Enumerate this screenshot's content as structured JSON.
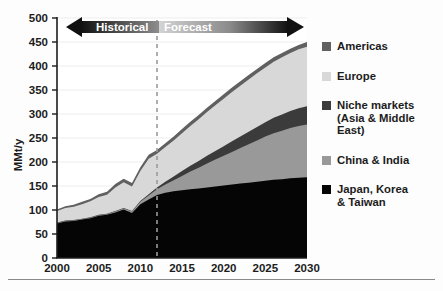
{
  "chart_data": {
    "type": "area",
    "stacked": true,
    "title": "",
    "xlabel": "",
    "ylabel": "MMt/y",
    "xlim": [
      2000,
      2030
    ],
    "ylim": [
      0,
      500
    ],
    "xticks": [
      2000,
      2005,
      2010,
      2015,
      2020,
      2025,
      2030
    ],
    "yticks": [
      0,
      50,
      100,
      150,
      200,
      250,
      300,
      350,
      400,
      450,
      500
    ],
    "grid": true,
    "grid_axis": "y",
    "legend_position": "right",
    "x": [
      2000,
      2001,
      2002,
      2003,
      2004,
      2005,
      2006,
      2007,
      2008,
      2009,
      2010,
      2011,
      2012,
      2013,
      2014,
      2015,
      2016,
      2017,
      2018,
      2019,
      2020,
      2021,
      2022,
      2023,
      2024,
      2025,
      2026,
      2027,
      2028,
      2029,
      2030
    ],
    "series": [
      {
        "name": "Japan, Korea & Taiwan",
        "color": "#050505",
        "values": [
          72,
          76,
          77,
          80,
          83,
          88,
          90,
          95,
          101,
          94,
          112,
          122,
          131,
          136,
          139,
          141,
          143,
          145,
          147,
          149,
          151,
          153,
          155,
          157,
          159,
          161,
          163,
          164,
          166,
          167,
          168
        ]
      },
      {
        "name": "China & India",
        "color": "#999999",
        "values": [
          1,
          1,
          1,
          1,
          1,
          1,
          1,
          2,
          2,
          3,
          5,
          8,
          12,
          17,
          23,
          30,
          37,
          43,
          50,
          56,
          62,
          68,
          74,
          80,
          86,
          92,
          97,
          101,
          105,
          108,
          110
        ]
      },
      {
        "name": "Niche markets (Asia & Middle East)",
        "color": "#3b3b3b",
        "values": [
          1,
          1,
          1,
          1,
          1,
          1,
          1,
          1,
          1,
          1,
          2,
          3,
          4,
          6,
          8,
          10,
          12,
          14,
          16,
          18,
          20,
          22,
          24,
          26,
          28,
          30,
          32,
          34,
          35,
          37,
          38
        ]
      },
      {
        "name": "Europe",
        "color": "#d8d8d8",
        "values": [
          24,
          26,
          28,
          30,
          33,
          37,
          40,
          49,
          54,
          51,
          62,
          74,
          70,
          72,
          75,
          79,
          83,
          87,
          91,
          95,
          99,
          103,
          106,
          109,
          112,
          114,
          117,
          119,
          121,
          123,
          124
        ]
      },
      {
        "name": "Americas",
        "color": "#606060",
        "values": [
          3,
          4,
          4,
          5,
          5,
          6,
          6,
          7,
          7,
          7,
          8,
          8,
          8,
          8,
          8,
          9,
          9,
          9,
          9,
          9,
          9,
          9,
          9,
          9,
          9,
          9,
          9,
          9,
          9,
          9,
          10
        ]
      }
    ],
    "totals_note": "Stacked totals rise from about 101 MMt/y in 2000 to about 450 MMt/y in 2030",
    "annotations": [
      {
        "name": "historical-forecast-divider",
        "type": "vline",
        "x": 2012,
        "style": "dashed",
        "color": "#9a9a9a"
      },
      {
        "name": "historical-label",
        "type": "text",
        "text": "Historical"
      },
      {
        "name": "forecast-label",
        "type": "text",
        "text": "Forecast"
      }
    ]
  },
  "axes": {
    "y_title": "MMt/y",
    "y_tick_labels": [
      "500",
      "450",
      "400",
      "350",
      "300",
      "250",
      "200",
      "150",
      "100",
      "50",
      "0"
    ],
    "x_tick_labels": [
      "2000",
      "2005",
      "2010",
      "2015",
      "2020",
      "2025",
      "2030"
    ]
  },
  "band": {
    "historical_label": "Historical",
    "forecast_label": "Forecast"
  },
  "legend": {
    "items": [
      {
        "label": "Americas",
        "color": "#606060"
      },
      {
        "label": "Europe",
        "color": "#d8d8d8"
      },
      {
        "label": "Niche markets\n(Asia & Middle East)",
        "color": "#3b3b3b"
      },
      {
        "label": "China & India",
        "color": "#999999"
      },
      {
        "label": "Japan, Korea\n& Taiwan",
        "color": "#050505"
      }
    ]
  },
  "colors": {
    "americas": "#606060",
    "europe": "#d8d8d8",
    "niche": "#3b3b3b",
    "china_india": "#999999",
    "japan_korea_taiwan": "#050505",
    "divider": "#9a9a9a",
    "axis": "#1c1c1c",
    "grid": "#e4e4e4"
  }
}
